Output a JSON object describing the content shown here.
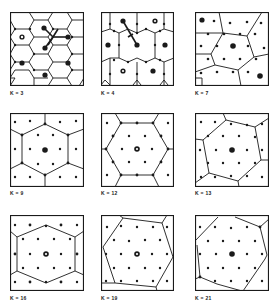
{
  "figure": {
    "panels": [
      {
        "label": "K = 3"
      },
      {
        "label": "K = 4"
      },
      {
        "label": "K = 7"
      },
      {
        "label": "K = 9"
      },
      {
        "label": "K = 12"
      },
      {
        "label": "K = 13"
      },
      {
        "label": "K = 16"
      },
      {
        "label": "K = 19"
      },
      {
        "label": "K = 21"
      }
    ]
  },
  "colors": {
    "ink": "#1a1a1a",
    "background": "#ffffff"
  }
}
